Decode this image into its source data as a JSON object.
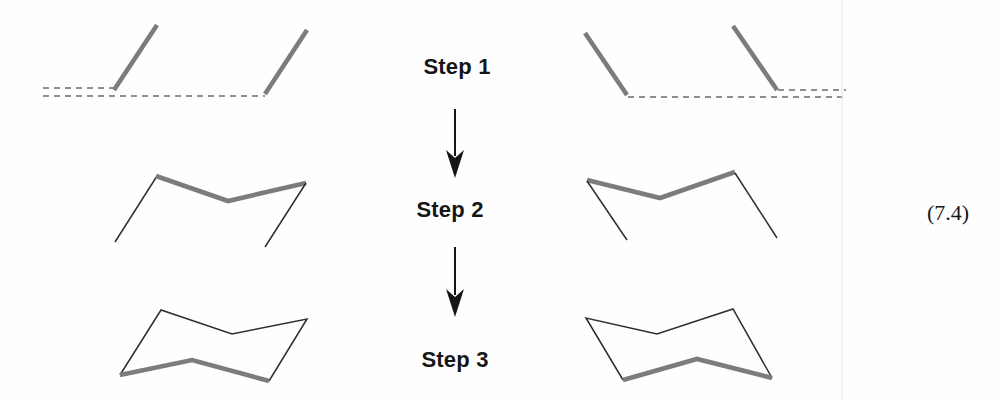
{
  "figure": {
    "equation_number": "(7.4)",
    "steps": [
      {
        "label": "Step 1"
      },
      {
        "label": "Step 2"
      },
      {
        "label": "Step 3"
      }
    ],
    "colors": {
      "thick_stroke": "#7c7c7c",
      "thin_stroke": "#2e2e2e",
      "dash_stroke": "#8e8e8e",
      "page_edge_stroke": "#e8e8e8",
      "ink": "#161616",
      "background": "#fefefe"
    },
    "canvas": {
      "width": 1001,
      "height": 401
    },
    "shapes": [
      {
        "id": "left-step1-top-dashed-guide",
        "type": "dashed",
        "points": [
          [
            43,
            88
          ],
          [
            113,
            88
          ]
        ]
      },
      {
        "id": "left-step1-bottom-dashed-guide",
        "type": "dashed",
        "points": [
          [
            43,
            96
          ],
          [
            265,
            96
          ]
        ]
      },
      {
        "id": "left-step1-parallel-line-1",
        "type": "thick",
        "points": [
          [
            114,
            90
          ],
          [
            157,
            25
          ]
        ]
      },
      {
        "id": "left-step1-parallel-line-2",
        "type": "thick",
        "points": [
          [
            265,
            94
          ],
          [
            307,
            30
          ]
        ]
      },
      {
        "id": "right-step1-parallel-line-1",
        "type": "thick",
        "points": [
          [
            585,
            33
          ],
          [
            627,
            95
          ]
        ]
      },
      {
        "id": "right-step1-parallel-line-2",
        "type": "thick",
        "points": [
          [
            733,
            26
          ],
          [
            777,
            90
          ]
        ]
      },
      {
        "id": "right-step1-top-dashed-guide",
        "type": "dashed",
        "points": [
          [
            778,
            90
          ],
          [
            846,
            90
          ]
        ]
      },
      {
        "id": "right-step1-bottom-dashed-guide",
        "type": "dashed",
        "points": [
          [
            628,
            97
          ],
          [
            846,
            97
          ]
        ]
      },
      {
        "id": "left-step2-left-thin-line",
        "type": "thin",
        "points": [
          [
            115,
            242
          ],
          [
            157,
            176
          ]
        ]
      },
      {
        "id": "left-step2-thick-vee",
        "type": "thick",
        "points": [
          [
            156,
            176
          ],
          [
            228,
            201
          ],
          [
            306,
            183
          ]
        ]
      },
      {
        "id": "left-step2-right-thin-line",
        "type": "thin",
        "points": [
          [
            306,
            183
          ],
          [
            265,
            247
          ]
        ]
      },
      {
        "id": "right-step2-thick-vee",
        "type": "thick",
        "points": [
          [
            587,
            180
          ],
          [
            660,
            198
          ],
          [
            735,
            172
          ]
        ]
      },
      {
        "id": "right-step2-left-thin-line",
        "type": "thin",
        "points": [
          [
            587,
            181
          ],
          [
            627,
            240
          ]
        ]
      },
      {
        "id": "right-step2-right-thin-line",
        "type": "thin",
        "points": [
          [
            735,
            173
          ],
          [
            777,
            238
          ]
        ]
      },
      {
        "id": "left-step3-chair-thin-edges",
        "type": "thin",
        "points": [
          [
            120,
            375
          ],
          [
            161,
            310
          ],
          [
            232,
            334
          ],
          [
            307,
            319
          ],
          [
            269,
            381
          ]
        ]
      },
      {
        "id": "left-step3-chair-thick-bottom",
        "type": "thick",
        "points": [
          [
            269,
            381
          ],
          [
            192,
            360
          ],
          [
            120,
            375
          ]
        ]
      },
      {
        "id": "right-step3-chair-thin-edges",
        "type": "thin",
        "points": [
          [
            623,
            380
          ],
          [
            586,
            318
          ],
          [
            657,
            334
          ],
          [
            733,
            309
          ],
          [
            772,
            378
          ]
        ]
      },
      {
        "id": "right-step3-chair-thick-bottom",
        "type": "thick",
        "points": [
          [
            772,
            378
          ],
          [
            697,
            359
          ],
          [
            623,
            380
          ]
        ]
      },
      {
        "id": "page-edge-line",
        "type": "edge",
        "points": [
          [
            842,
            0
          ],
          [
            842,
            401
          ]
        ]
      }
    ],
    "arrows": [
      {
        "id": "down-arrow-step1-to-step2",
        "x": 455,
        "y1": 109,
        "y2": 178
      },
      {
        "id": "down-arrow-step2-to-step3",
        "x": 455,
        "y1": 247,
        "y2": 317
      }
    ]
  }
}
